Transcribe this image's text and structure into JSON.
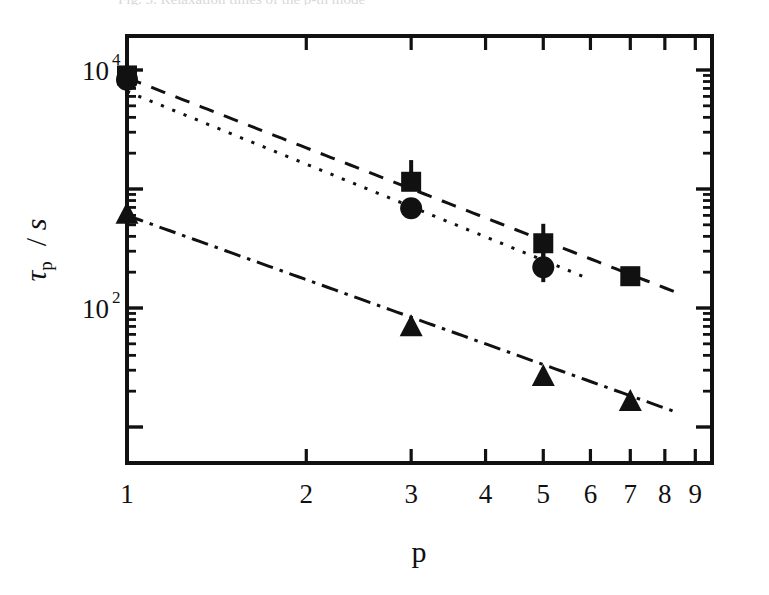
{
  "figure": {
    "caption_remnant": "Fig. 5. Relaxation times of the p-th mode",
    "background_color": "#ffffff",
    "ink_color": "#111111"
  },
  "chart_data": {
    "type": "scatter",
    "title": "",
    "subtitle": "",
    "xlabel": "p",
    "ylabel": "τp / s",
    "ylabel_parts": {
      "symbol": "τ",
      "subscript": "p",
      "separator": "/",
      "unit": "s"
    },
    "xscale": "log",
    "yscale": "log",
    "xlim": [
      1,
      9.6
    ],
    "ylim": [
      10.5,
      31000
    ],
    "grid": false,
    "legend": "none",
    "x_tick_labels": [
      "1",
      "2",
      "3",
      "4",
      "5",
      "6",
      "7",
      "8",
      "9"
    ],
    "x_tick_values": [
      1,
      2,
      3,
      4,
      5,
      6,
      7,
      8,
      9
    ],
    "y_tick_labels": [
      "10^4",
      "10^2"
    ],
    "y_tick_values": [
      10000,
      100
    ],
    "y_tick_label_bases": [
      "10",
      "10"
    ],
    "y_tick_label_exponents": [
      "4",
      "2"
    ],
    "series": [
      {
        "name": "squares",
        "marker": "filled-square",
        "linestyle": "dashed",
        "x": [
          1,
          3,
          5,
          7
        ],
        "values": [
          9000,
          1150,
          350,
          185
        ],
        "yerr_up": [
          2600,
          600,
          160,
          0
        ],
        "yerr_down": [
          2000,
          0,
          90,
          0
        ],
        "fit_x": [
          1,
          8.6
        ],
        "fit_y": [
          8600,
          128
        ]
      },
      {
        "name": "circles",
        "marker": "filled-circle",
        "linestyle": "dotted",
        "x": [
          1,
          3,
          5
        ],
        "values": [
          8300,
          690,
          220
        ],
        "yerr_up": [
          2000,
          0,
          70
        ],
        "yerr_down": [
          1800,
          0,
          55
        ],
        "fit_x": [
          1,
          5.9
        ],
        "fit_y": [
          6600,
          180
        ]
      },
      {
        "name": "triangles",
        "marker": "filled-triangle-up",
        "linestyle": "dash-dot",
        "x": [
          1,
          3,
          5,
          7
        ],
        "values": [
          600,
          68,
          26,
          16
        ],
        "yerr_up": [
          0,
          0,
          0,
          0
        ],
        "yerr_down": [
          0,
          0,
          0,
          0
        ],
        "fit_x": [
          1,
          8.4
        ],
        "fit_y": [
          600,
          13.2
        ]
      }
    ]
  }
}
